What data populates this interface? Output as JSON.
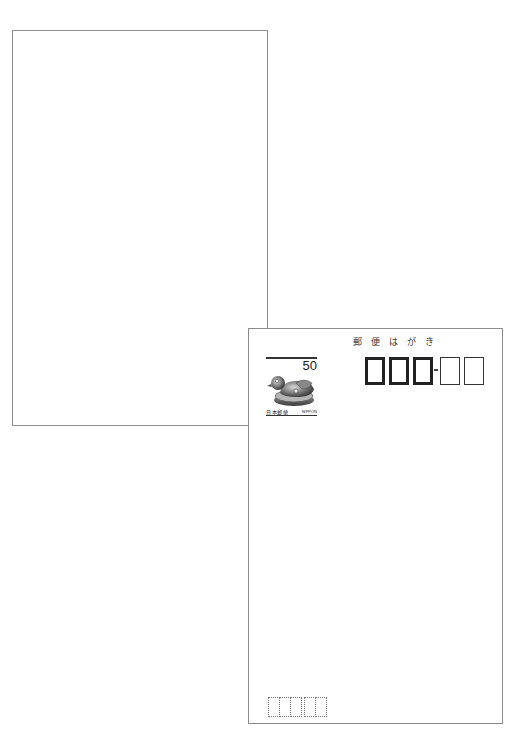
{
  "cards": {
    "back": {
      "description": "blank postcard back"
    },
    "front": {
      "title_chars": [
        "郵",
        "便",
        "は",
        "が",
        "き"
      ],
      "stamp": {
        "value": "50",
        "label_left": "日本郵便",
        "label_right": "NIPPON",
        "image": "mandarin-duck"
      },
      "postal_code": {
        "primary_boxes": 3,
        "secondary_boxes": 2,
        "separator": "-"
      },
      "sender_postal_code": {
        "primary_boxes": 3,
        "secondary_boxes": 2
      }
    }
  },
  "colors": {
    "border": "#8c8c8c",
    "ink": "#222222",
    "background": "#ffffff"
  }
}
